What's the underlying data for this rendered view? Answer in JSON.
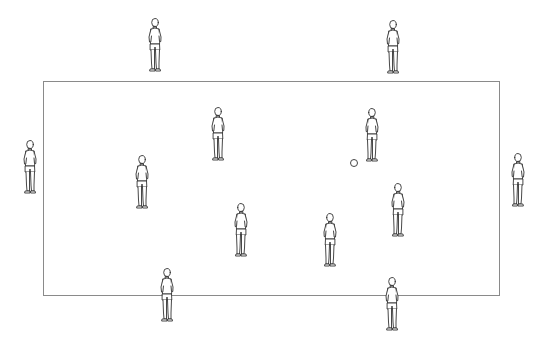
{
  "diagram": {
    "type": "soccer-drill-setup",
    "field": {
      "x": 43,
      "y": 81,
      "width": 457,
      "height": 215,
      "line_color": "#8a8a8a"
    },
    "players": [
      {
        "id": "outside-top-left",
        "zone": "outside",
        "x": 144,
        "y": 17,
        "facing": "right"
      },
      {
        "id": "outside-top-right",
        "zone": "outside",
        "x": 382,
        "y": 19,
        "facing": "right"
      },
      {
        "id": "outside-left",
        "zone": "outside",
        "x": 19,
        "y": 139,
        "facing": "right"
      },
      {
        "id": "outside-right",
        "zone": "outside",
        "x": 507,
        "y": 152,
        "facing": "left"
      },
      {
        "id": "outside-bottom-left",
        "zone": "outside",
        "x": 156,
        "y": 267,
        "facing": "away"
      },
      {
        "id": "outside-bottom-right",
        "zone": "outside",
        "x": 381,
        "y": 276,
        "facing": "away"
      },
      {
        "id": "inside-1",
        "zone": "inside",
        "x": 207,
        "y": 106,
        "facing": "right"
      },
      {
        "id": "inside-2",
        "zone": "inside",
        "x": 131,
        "y": 154,
        "facing": "right"
      },
      {
        "id": "inside-3",
        "zone": "inside",
        "x": 361,
        "y": 107,
        "facing": "left"
      },
      {
        "id": "inside-4",
        "zone": "inside",
        "x": 387,
        "y": 182,
        "facing": "left"
      },
      {
        "id": "inside-5",
        "zone": "inside",
        "x": 230,
        "y": 202,
        "facing": "left"
      },
      {
        "id": "inside-6",
        "zone": "inside",
        "x": 319,
        "y": 212,
        "facing": "left"
      }
    ],
    "ball": {
      "x": 350,
      "y": 159,
      "size": 8
    },
    "stroke_color": "#333333"
  }
}
